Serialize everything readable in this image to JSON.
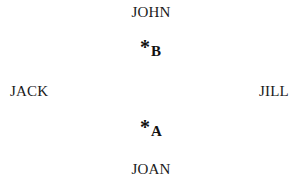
{
  "diagram": {
    "people": {
      "top": "JOHN",
      "bottom": "JOAN",
      "left": "JACK",
      "right": "JILL"
    },
    "points": {
      "upper": {
        "symbol": "*",
        "label": "B"
      },
      "lower": {
        "symbol": "*",
        "label": "A"
      }
    }
  }
}
